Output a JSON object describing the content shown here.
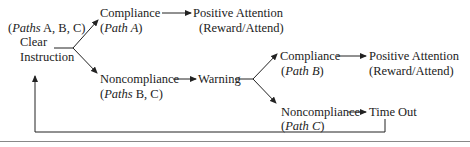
{
  "diagram": {
    "start": {
      "paths_note_prefix": "(",
      "paths_note_italic": "Paths",
      "paths_note_rest": " A, B, C)",
      "line1": "Clear",
      "line2": "Instruction"
    },
    "compliance_a": {
      "label": "Compliance",
      "path_prefix": "(",
      "path_italic": "Path A",
      "path_suffix": ")"
    },
    "positive_a": {
      "label": "Positive Attention",
      "sub": "(Reward/Attend)"
    },
    "noncompliance_bc": {
      "label": "Noncompliance",
      "path_prefix": "(",
      "path_italic": "Paths",
      "path_rest": " B, C)"
    },
    "warning": {
      "label": "Warning"
    },
    "compliance_b": {
      "label": "Compliance",
      "path_prefix": "(",
      "path_italic": "Path B",
      "path_suffix": ")"
    },
    "positive_b": {
      "label": "Positive Attention",
      "sub": "(Reward/Attend)"
    },
    "noncompliance_c": {
      "label": "Noncompliance",
      "path_prefix": "(",
      "path_italic": "Path C",
      "path_suffix": ")"
    },
    "timeout": {
      "label": "Time Out"
    },
    "colors": {
      "ink": "#222222",
      "rule": "#888888"
    }
  }
}
